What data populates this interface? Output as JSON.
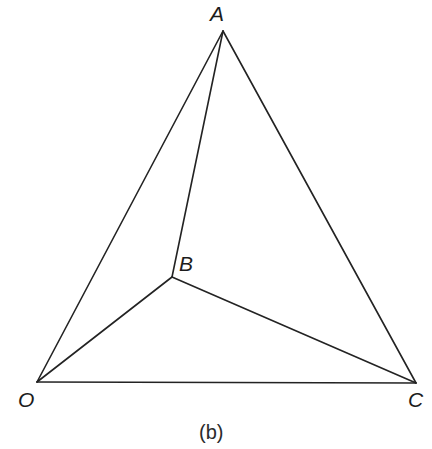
{
  "figure": {
    "caption": "(b)",
    "caption_x": 199,
    "caption_y": 422,
    "background_color": "#ffffff",
    "line_color": "#232323",
    "label_color": "#1c1c1c",
    "line_width": 1.6,
    "width": 432,
    "height": 449
  },
  "chart_data": {
    "type": "diagram",
    "title": "(b)",
    "vertices": [
      {
        "id": "A",
        "label": "A",
        "x": 223,
        "y": 31,
        "label_x": 210,
        "label_y": 3,
        "role": "apex"
      },
      {
        "id": "B",
        "label": "B",
        "x": 172,
        "y": 277,
        "label_x": 179,
        "label_y": 253,
        "role": "interior"
      },
      {
        "id": "O",
        "label": "O",
        "x": 37,
        "y": 382,
        "label_x": 18,
        "label_y": 389,
        "role": "bottom-left"
      },
      {
        "id": "C",
        "label": "C",
        "x": 416,
        "y": 383,
        "label_x": 408,
        "label_y": 389,
        "role": "bottom-right"
      }
    ],
    "edges": [
      {
        "id": "OA",
        "from": "O",
        "to": "A",
        "x1": 37,
        "y1": 382,
        "x2": 223,
        "y2": 31
      },
      {
        "id": "AC",
        "from": "A",
        "to": "C",
        "x1": 223,
        "y1": 31,
        "x2": 416,
        "y2": 383
      },
      {
        "id": "OC",
        "from": "O",
        "to": "C",
        "x1": 37,
        "y1": 382,
        "x2": 416,
        "y2": 383
      },
      {
        "id": "AB",
        "from": "A",
        "to": "B",
        "x1": 223,
        "y1": 31,
        "x2": 172,
        "y2": 277
      },
      {
        "id": "OB",
        "from": "O",
        "to": "B",
        "x1": 37,
        "y1": 382,
        "x2": 172,
        "y2": 277
      },
      {
        "id": "BC",
        "from": "B",
        "to": "C",
        "x1": 172,
        "y1": 277,
        "x2": 416,
        "y2": 383
      }
    ],
    "xlabel": "",
    "ylabel": "",
    "grid": false,
    "legend": false
  }
}
